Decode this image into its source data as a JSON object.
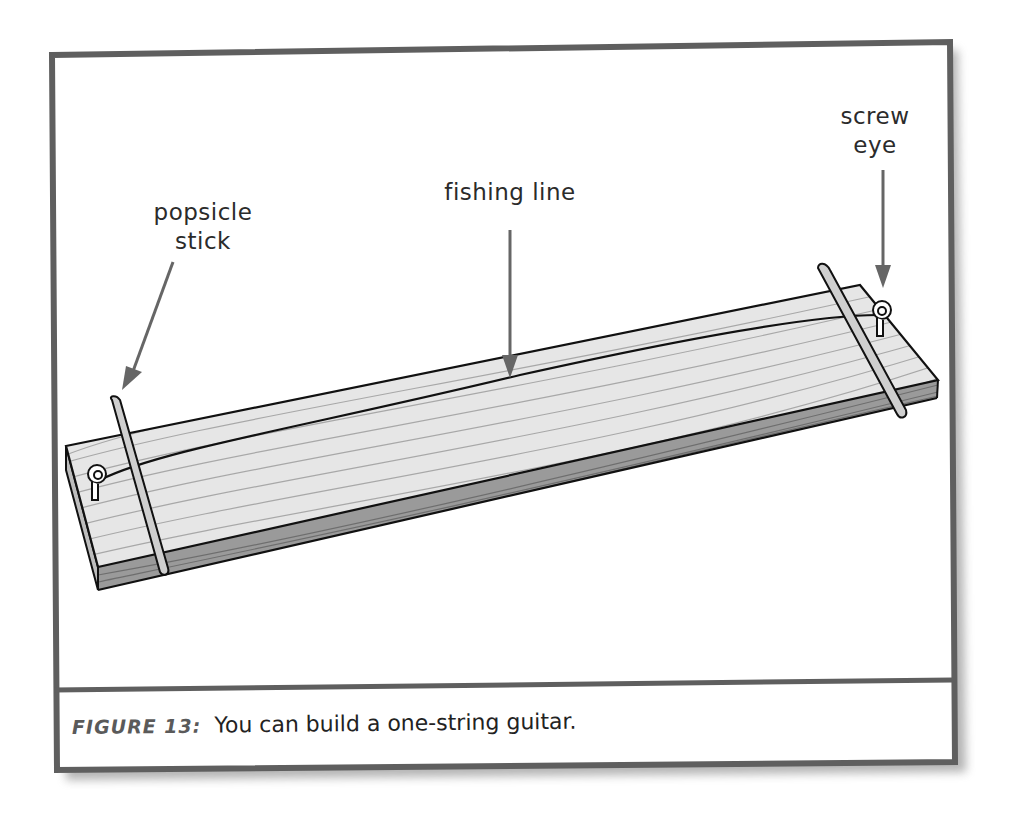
{
  "figure": {
    "number_label": "FIGURE 13:",
    "caption": "You can build a one-string guitar.",
    "labels": {
      "popsicle_stick": [
        "popsicle",
        "stick"
      ],
      "fishing_line": "fishing line",
      "screw_eye": [
        "screw",
        "eye"
      ]
    },
    "colors": {
      "frame": "#5f5f5f",
      "wood_top": "#e4e4e4",
      "wood_side": "#9a9a9a",
      "grain": "#a8a8a8",
      "stick": "#cfcfcf",
      "arrow": "#666666",
      "outline": "#111111"
    }
  }
}
